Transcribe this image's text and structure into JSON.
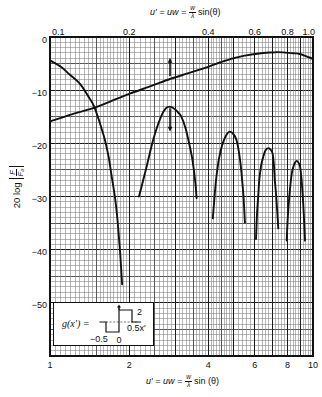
{
  "chart_data": {
    "type": "line",
    "title": "",
    "xlabel_top": {
      "text": "u′ = uw = (w/λ) sin(θ)",
      "lhs": "u′ = uw =",
      "numerator": "w",
      "denominator": "λ",
      "rhs": "sin(θ)"
    },
    "xlabel_bottom": {
      "text": "u′ = uw = (w/λ) sin (θ)",
      "lhs": "u′ = uw =",
      "numerator": "w",
      "denominator": "λ",
      "rhs": "sin (θ)"
    },
    "ylabel": {
      "text": "20 log |F/F₀|",
      "prefix": "20 log",
      "numerator": "F",
      "denominator": "F₀"
    },
    "x_scale": "log",
    "xlim_bottom": [
      1,
      10
    ],
    "xlim_top": [
      0.1,
      1.0
    ],
    "ylim": [
      -60,
      0
    ],
    "xticks_bottom": [
      1,
      2,
      4,
      6,
      8,
      10
    ],
    "xtick_labels_bottom": [
      "1",
      "2",
      "4",
      "6",
      "8",
      "10"
    ],
    "xticks_top": [
      0.1,
      0.2,
      0.4,
      0.6,
      0.8,
      1.0
    ],
    "xtick_labels_top": [
      "0.1",
      "0.2",
      "0.4",
      "0.6",
      "0.8",
      "1.0"
    ],
    "yticks": [
      0,
      -10,
      -20,
      -30,
      -40,
      -50
    ],
    "ytick_labels": [
      "0",
      "−10",
      "−20",
      "−30",
      "−40",
      "−50"
    ],
    "grid": true,
    "legend": null,
    "series": [
      {
        "name": "rising curve",
        "axis": "top",
        "points": [
          [
            0.1,
            -15.9
          ],
          [
            0.12,
            -14.6
          ],
          [
            0.146,
            -13.4
          ],
          [
            0.17,
            -12.1
          ],
          [
            0.2,
            -10.7
          ],
          [
            0.24,
            -9.3
          ],
          [
            0.286,
            -7.9
          ],
          [
            0.341,
            -6.7
          ],
          [
            0.4,
            -5.6
          ],
          [
            0.443,
            -4.8
          ],
          [
            0.483,
            -4.2
          ],
          [
            0.55,
            -3.5
          ],
          [
            0.646,
            -3.0
          ],
          [
            0.72,
            -2.85
          ],
          [
            0.77,
            -2.9
          ],
          [
            0.84,
            -3.05
          ],
          [
            0.89,
            -3.2
          ],
          [
            0.94,
            -3.6
          ],
          [
            1.0,
            -4.1
          ]
        ]
      },
      {
        "name": "main lobe",
        "axis": "bottom",
        "points": [
          [
            1.0,
            -4.4
          ],
          [
            1.1,
            -5.6
          ],
          [
            1.19,
            -7.1
          ],
          [
            1.3,
            -8.8
          ],
          [
            1.4,
            -11.2
          ],
          [
            1.47,
            -13.0
          ],
          [
            1.55,
            -16.3
          ],
          [
            1.62,
            -19.5
          ],
          [
            1.67,
            -22.5
          ],
          [
            1.72,
            -26.5
          ],
          [
            1.77,
            -30.5
          ],
          [
            1.81,
            -35.0
          ],
          [
            1.85,
            -41.0
          ],
          [
            1.88,
            -46.5
          ]
        ]
      },
      {
        "name": "side lobe 1",
        "axis": "bottom",
        "points": [
          [
            2.18,
            -30.0
          ],
          [
            2.26,
            -27.0
          ],
          [
            2.33,
            -24.4
          ],
          [
            2.42,
            -21.0
          ],
          [
            2.51,
            -18.1
          ],
          [
            2.66,
            -14.7
          ],
          [
            2.76,
            -13.4
          ],
          [
            2.86,
            -13.1
          ],
          [
            2.97,
            -13.5
          ],
          [
            3.07,
            -14.2
          ],
          [
            3.16,
            -15.0
          ],
          [
            3.27,
            -17.0
          ],
          [
            3.36,
            -19.4
          ],
          [
            3.45,
            -22.0
          ],
          [
            3.51,
            -24.4
          ],
          [
            3.57,
            -27.5
          ],
          [
            3.61,
            -30.3
          ]
        ]
      },
      {
        "name": "side lobe 2",
        "axis": "bottom",
        "points": [
          [
            4.16,
            -34.1
          ],
          [
            4.24,
            -29.0
          ],
          [
            4.3,
            -26.0
          ],
          [
            4.37,
            -23.5
          ],
          [
            4.46,
            -21.3
          ],
          [
            4.56,
            -19.7
          ],
          [
            4.7,
            -18.3
          ],
          [
            4.83,
            -17.8
          ],
          [
            4.97,
            -18.2
          ],
          [
            5.12,
            -19.4
          ],
          [
            5.27,
            -22.8
          ],
          [
            5.38,
            -27.0
          ],
          [
            5.45,
            -30.5
          ],
          [
            5.51,
            -34.9
          ]
        ]
      },
      {
        "name": "side lobe 3",
        "axis": "bottom",
        "points": [
          [
            6.07,
            -38.0
          ],
          [
            6.13,
            -33.0
          ],
          [
            6.19,
            -30.0
          ],
          [
            6.25,
            -26.9
          ],
          [
            6.35,
            -24.2
          ],
          [
            6.47,
            -22.5
          ],
          [
            6.6,
            -21.3
          ],
          [
            6.76,
            -20.9
          ],
          [
            6.9,
            -21.2
          ],
          [
            7.02,
            -21.9
          ],
          [
            7.1,
            -24.0
          ],
          [
            7.16,
            -26.9
          ],
          [
            7.26,
            -30.5
          ],
          [
            7.38,
            -36.0
          ]
        ]
      },
      {
        "name": "side lobe 4",
        "axis": "bottom",
        "points": [
          [
            7.94,
            -38.3
          ],
          [
            8.04,
            -33.0
          ],
          [
            8.17,
            -28.8
          ],
          [
            8.3,
            -25.8
          ],
          [
            8.42,
            -24.4
          ],
          [
            8.55,
            -23.6
          ],
          [
            8.67,
            -23.3
          ],
          [
            8.8,
            -23.6
          ],
          [
            8.93,
            -24.4
          ],
          [
            9.03,
            -26.3
          ],
          [
            9.13,
            -29.4
          ],
          [
            9.22,
            -33.0
          ],
          [
            9.32,
            -38.3
          ]
        ]
      }
    ],
    "annotations": [
      {
        "type": "arrow",
        "direction": "up",
        "u_bottom": 2.86,
        "from_db": -7.4,
        "to_db": -3.9
      },
      {
        "type": "arrow",
        "direction": "down",
        "u_bottom": 2.86,
        "from_db": -13.4,
        "to_db": -17.8
      }
    ],
    "inset": {
      "label": "g(x′) =",
      "step_points": [
        [
          -0.75,
          0
        ],
        [
          -0.5,
          0
        ],
        [
          -0.5,
          -1
        ],
        [
          0,
          -1
        ],
        [
          0,
          1.2
        ],
        [
          0.5,
          1.2
        ],
        [
          0.5,
          0
        ],
        [
          0.85,
          0
        ]
      ],
      "dashed_baseline": [
        -0.5,
        0.7
      ],
      "labels": {
        "height": "2",
        "right_x": "0.5x′",
        "left_x": "−0.5",
        "origin": "0"
      }
    }
  }
}
